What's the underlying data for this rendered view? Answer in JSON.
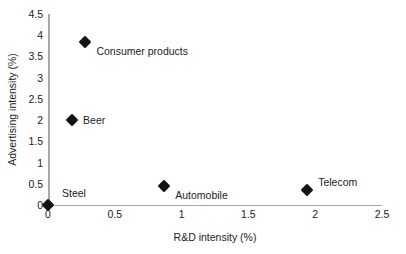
{
  "chart_data": {
    "type": "scatter",
    "title": "",
    "xlabel": "R&D intensity (%)",
    "ylabel": "Advertising intensity (%)",
    "xlim": [
      0,
      2.5
    ],
    "ylim": [
      0,
      4.5
    ],
    "grid": false,
    "legend": "none",
    "marker": "diamond",
    "marker_color": "#141414",
    "axis_color": "#a8a8a8",
    "xticks": [
      "0",
      "0.5",
      "1",
      "1.5",
      "2",
      "2.5"
    ],
    "xtick_values": [
      0,
      0.5,
      1,
      1.5,
      2,
      2.5
    ],
    "yticks": [
      "0",
      "0.5",
      "1",
      "1.5",
      "2",
      "2.5",
      "3",
      "3.5",
      "4",
      "4.5"
    ],
    "ytick_values": [
      0,
      0.5,
      1,
      1.5,
      2,
      2.5,
      3,
      3.5,
      4,
      4.5
    ],
    "points": [
      {
        "label": "Consumer products",
        "x": 0.28,
        "y": 3.85,
        "label_pos": "right-below"
      },
      {
        "label": "Beer",
        "x": 0.18,
        "y": 2.0,
        "label_pos": "right"
      },
      {
        "label": "Automobile",
        "x": 0.87,
        "y": 0.45,
        "label_pos": "right-below"
      },
      {
        "label": "Telecom",
        "x": 1.94,
        "y": 0.35,
        "label_pos": "right-above"
      },
      {
        "label": "Steel",
        "x": 0.0,
        "y": 0.0,
        "label_pos": "above-right"
      }
    ]
  }
}
